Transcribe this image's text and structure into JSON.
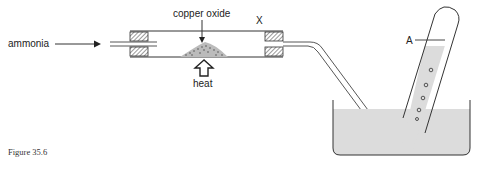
{
  "figure": {
    "caption": "Figure 35.6",
    "labels": {
      "inlet_gas": "ammonia",
      "solid": "copper oxide",
      "heat": "heat",
      "tube_mark": "X",
      "collected_gas": "A"
    }
  },
  "apparatus": {
    "components": [
      "inlet-tube",
      "left-bung",
      "combustion-tube",
      "copper-oxide-heap",
      "heat-arrow",
      "right-bung",
      "delivery-tube",
      "water-trough",
      "inverted-test-tube",
      "gas-bubbles"
    ],
    "colors": {
      "line": "#333333",
      "water": "#dcdcdc",
      "hatch": "#555555"
    }
  }
}
